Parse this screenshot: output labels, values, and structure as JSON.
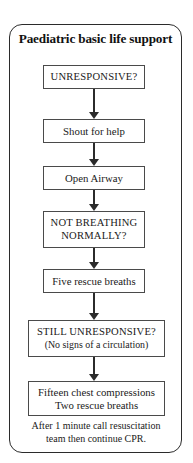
{
  "chart_data": {
    "type": "diagram",
    "title": "Paediatric basic life support",
    "diagram_kind": "flowchart",
    "orientation": "top-to-bottom",
    "nodes": [
      {
        "id": "unresponsive",
        "label": "UNRESPONSIVE?",
        "style": "caps"
      },
      {
        "id": "shout",
        "label": "Shout for help",
        "style": "normal"
      },
      {
        "id": "airway",
        "label": "Open Airway",
        "style": "normal"
      },
      {
        "id": "notbreathing",
        "label_line1": "NOT BREATHING",
        "label_line2": "NORMALLY?",
        "style": "caps"
      },
      {
        "id": "fiverescue",
        "label": "Five rescue breaths",
        "style": "normal"
      },
      {
        "id": "stillunresp",
        "label_line1": "STILL UNRESPONSIVE?",
        "label_line2": "(No signs of a circulation)",
        "style": "caps"
      },
      {
        "id": "compressions",
        "label_line1": "Fifteen chest compressions",
        "label_line2": "Two rescue breaths",
        "style": "normal"
      }
    ],
    "edges": [
      {
        "from": "unresponsive",
        "to": "shout"
      },
      {
        "from": "shout",
        "to": "airway"
      },
      {
        "from": "airway",
        "to": "notbreathing"
      },
      {
        "from": "notbreathing",
        "to": "fiverescue"
      },
      {
        "from": "fiverescue",
        "to": "stillunresp"
      },
      {
        "from": "stillunresp",
        "to": "compressions"
      }
    ],
    "footer_line1": "After 1 minute call resuscitation",
    "footer_line2": "team then continue CPR.",
    "colors": {
      "background": "#ffffff",
      "border": "#2b2b2b",
      "box_border": "#4a4a4a",
      "text": "#1a1a1a"
    }
  }
}
